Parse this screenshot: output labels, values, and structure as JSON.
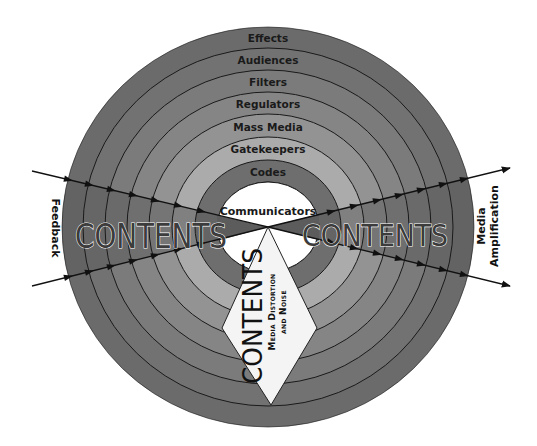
{
  "diagram": {
    "center": {
      "x": 268,
      "y": 227
    },
    "rings": [
      {
        "label": "Effects",
        "rx": 206,
        "ry": 200,
        "color": "#6b6b6b"
      },
      {
        "label": "Audiences",
        "rx": 185,
        "ry": 179,
        "color": "#727272"
      },
      {
        "label": "Filters",
        "rx": 163,
        "ry": 157,
        "color": "#7b7b7b"
      },
      {
        "label": "Regulators",
        "rx": 141,
        "ry": 135,
        "color": "#858585"
      },
      {
        "label": "Mass Media",
        "rx": 119,
        "ry": 113,
        "color": "#939393"
      },
      {
        "label": "Gatekeepers",
        "rx": 96,
        "ry": 90,
        "color": "#ababab"
      },
      {
        "label": "Codes",
        "rx": 73,
        "ry": 67,
        "color": "#6e6e6e"
      }
    ],
    "core": {
      "label": "Communicators",
      "rx": 51,
      "ry": 45,
      "color": "#ffffff"
    },
    "left_label": "Feedback",
    "right_label_line1": "Media",
    "right_label_line2": "Amplification",
    "left_contents": "CONTENTS",
    "right_contents": "CONTENTS",
    "bottom_contents": "CONTENTS",
    "bottom_sub_line1": "Media Distortion",
    "bottom_sub_line2": "and Noise",
    "colors": {
      "line": "#111111",
      "diamond_fill": "#f4f4f4",
      "wedge_fill": "#5a5a5a"
    }
  }
}
